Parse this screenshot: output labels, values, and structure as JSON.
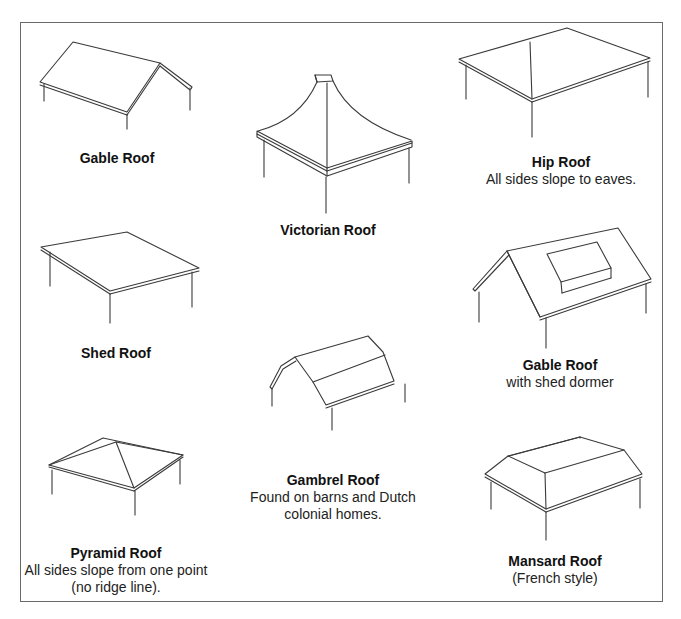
{
  "diagram": {
    "roofs": [
      {
        "id": "gable",
        "title": "Gable Roof",
        "description": ""
      },
      {
        "id": "victorian",
        "title": "Victorian Roof",
        "description": ""
      },
      {
        "id": "hip",
        "title": "Hip Roof",
        "description": "All sides slope to eaves."
      },
      {
        "id": "shed",
        "title": "Shed Roof",
        "description": ""
      },
      {
        "id": "gable-dormer",
        "title": "Gable Roof",
        "description": "with shed dormer"
      },
      {
        "id": "gambrel",
        "title": "Gambrel Roof",
        "description_line1": "Found on barns and Dutch",
        "description_line2": "colonial homes."
      },
      {
        "id": "pyramid",
        "title": "Pyramid Roof",
        "description_line1": "All sides slope from one point",
        "description_line2": "(no ridge line)."
      },
      {
        "id": "mansard",
        "title": "Mansard Roof",
        "description": "(French style)"
      }
    ]
  }
}
